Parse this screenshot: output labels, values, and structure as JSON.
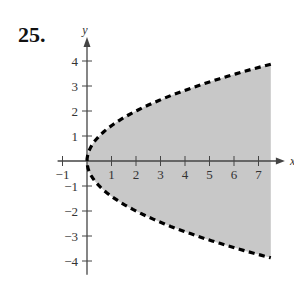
{
  "problem": {
    "number": "25."
  },
  "chart_data": {
    "type": "area",
    "title": "",
    "xlabel": "x",
    "ylabel": "y",
    "xlim": [
      -1.2,
      7.6
    ],
    "ylim": [
      -4.5,
      4.7
    ],
    "x_ticks": [
      -1,
      1,
      2,
      3,
      4,
      5,
      6,
      7
    ],
    "y_ticks": [
      -4,
      -3,
      -2,
      -1,
      1,
      2,
      3,
      4
    ],
    "x_tick_labels": [
      "−1",
      "1",
      "2",
      "3",
      "4",
      "5",
      "6",
      "7"
    ],
    "y_tick_labels": [
      "−4",
      "−3",
      "−2",
      "−1",
      "1",
      "2",
      "3",
      "4"
    ],
    "boundary": {
      "equation": "x = y^2 / 2",
      "style": "dashed",
      "color": "#000000"
    },
    "shaded_region": {
      "description": "y^2 < 2x (inside the parabola, opening right)",
      "x_range": [
        0,
        7.5
      ],
      "fill": "#c8c8c8"
    },
    "grid": false,
    "legend": null
  },
  "colors": {
    "fill": "#c8c8c8",
    "axis": "#444444",
    "boundary": "#000000"
  }
}
